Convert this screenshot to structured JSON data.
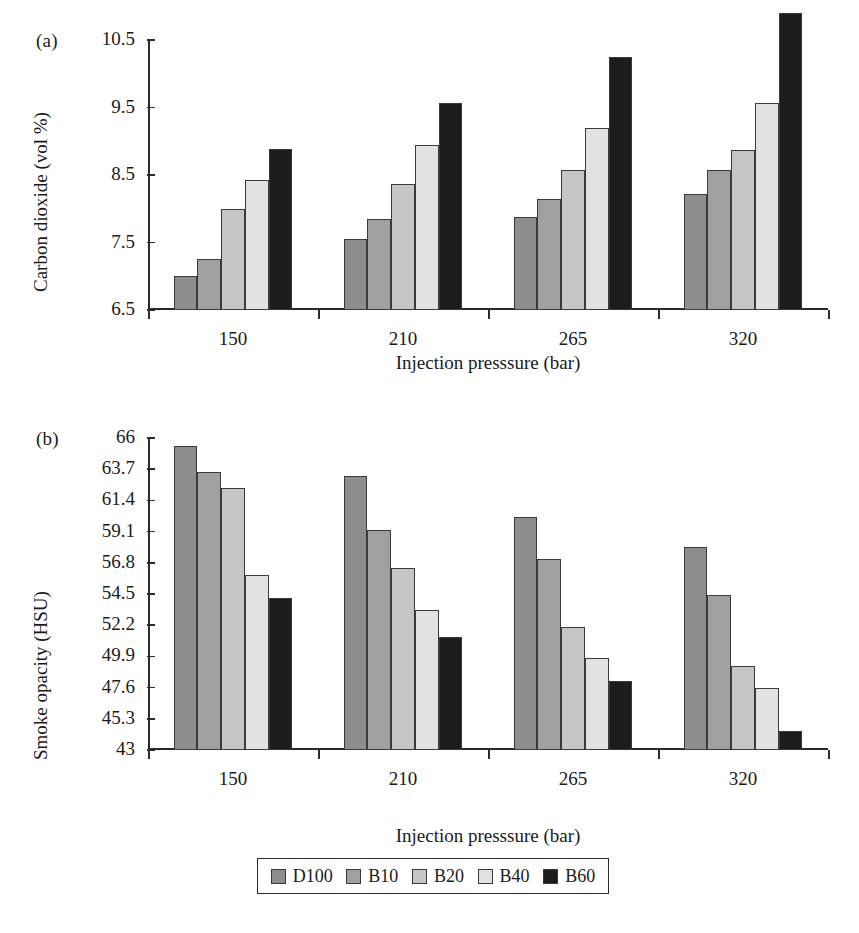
{
  "figure": {
    "panel_a_letter": "(a)",
    "panel_b_letter": "(b)"
  },
  "legend": {
    "position": "bottom-center",
    "items": [
      {
        "label": "D100",
        "color": "#8d8d8d"
      },
      {
        "label": "B10",
        "color": "#a0a0a0"
      },
      {
        "label": "B20",
        "color": "#c6c6c6"
      },
      {
        "label": "B40",
        "color": "#e2e2e2"
      },
      {
        "label": "B60",
        "color": "#1c1c1c"
      }
    ]
  },
  "chart_data": [
    {
      "type": "bar",
      "panel": "(a)",
      "title": "",
      "xlabel": "Injection presssure (bar)",
      "ylabel": "Carbon dioxide (vol %)",
      "categories": [
        "150",
        "210",
        "265",
        "320"
      ],
      "ylim": [
        6.5,
        10.5
      ],
      "yticks": [
        "6.5",
        "7.5",
        "8.5",
        "9.5",
        "10.5"
      ],
      "ytick_values": [
        6.5,
        7.5,
        8.5,
        9.5,
        10.5
      ],
      "grid": false,
      "legend_position": "bottom-center",
      "series": [
        {
          "name": "D100",
          "color": "#8d8d8d",
          "values": [
            7.0,
            7.55,
            7.88,
            8.22
          ]
        },
        {
          "name": "B10",
          "color": "#a0a0a0",
          "values": [
            7.25,
            7.85,
            8.15,
            8.57
          ]
        },
        {
          "name": "B20",
          "color": "#c6c6c6",
          "values": [
            8.0,
            8.37,
            8.57,
            8.87
          ]
        },
        {
          "name": "B40",
          "color": "#e2e2e2",
          "values": [
            8.42,
            8.95,
            9.2,
            9.57
          ]
        },
        {
          "name": "B60",
          "color": "#1c1c1c",
          "values": [
            8.88,
            9.57,
            10.25,
            10.9
          ]
        }
      ]
    },
    {
      "type": "bar",
      "panel": "(b)",
      "title": "",
      "xlabel": "Injection presssure (bar)",
      "ylabel": "Smoke opacity (HSU)",
      "categories": [
        "150",
        "210",
        "265",
        "320"
      ],
      "ylim": [
        43,
        66
      ],
      "yticks": [
        "43",
        "45.3",
        "47.6",
        "49.9",
        "52.2",
        "54.5",
        "56.8",
        "59.1",
        "61.4",
        "63.7",
        "66"
      ],
      "ytick_values": [
        43,
        45.3,
        47.6,
        49.9,
        52.2,
        54.5,
        56.8,
        59.1,
        61.4,
        63.7,
        66
      ],
      "grid": false,
      "legend_position": "bottom-center",
      "series": [
        {
          "name": "D100",
          "color": "#8d8d8d",
          "values": [
            65.4,
            63.2,
            60.2,
            58.0
          ]
        },
        {
          "name": "B10",
          "color": "#a0a0a0",
          "values": [
            63.5,
            59.2,
            57.1,
            54.4
          ]
        },
        {
          "name": "B20",
          "color": "#c6c6c6",
          "values": [
            62.3,
            56.4,
            52.1,
            49.2
          ]
        },
        {
          "name": "B40",
          "color": "#e2e2e2",
          "values": [
            55.9,
            53.3,
            49.8,
            47.6
          ]
        },
        {
          "name": "B60",
          "color": "#1c1c1c",
          "values": [
            54.2,
            51.3,
            48.1,
            44.4
          ]
        }
      ]
    }
  ]
}
